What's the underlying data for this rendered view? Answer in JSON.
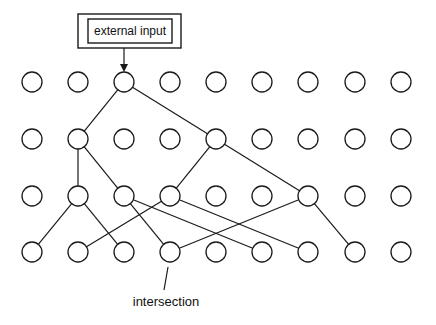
{
  "diagram": {
    "input_box": {
      "label": "external input"
    },
    "annotation": {
      "label": "intersection",
      "target": {
        "row": 3,
        "col": 3
      }
    },
    "grid": {
      "rows": 4,
      "cols": 9,
      "col_x": [
        32,
        78,
        124,
        170,
        216,
        262,
        308,
        355,
        401
      ],
      "row_y": [
        82,
        139,
        196,
        252
      ],
      "radius": 10
    },
    "input_target": {
      "row": 0,
      "col": 2
    },
    "edges": [
      {
        "from": [
          0,
          2
        ],
        "to": [
          1,
          1
        ]
      },
      {
        "from": [
          0,
          2
        ],
        "to": [
          1,
          4
        ]
      },
      {
        "from": [
          1,
          1
        ],
        "to": [
          2,
          1
        ]
      },
      {
        "from": [
          1,
          1
        ],
        "to": [
          2,
          2
        ]
      },
      {
        "from": [
          1,
          4
        ],
        "to": [
          2,
          3
        ]
      },
      {
        "from": [
          1,
          4
        ],
        "to": [
          2,
          6
        ]
      },
      {
        "from": [
          2,
          1
        ],
        "to": [
          3,
          0
        ]
      },
      {
        "from": [
          2,
          1
        ],
        "to": [
          3,
          2
        ]
      },
      {
        "from": [
          2,
          2
        ],
        "to": [
          3,
          3
        ]
      },
      {
        "from": [
          2,
          2
        ],
        "to": [
          3,
          5
        ]
      },
      {
        "from": [
          2,
          3
        ],
        "to": [
          3,
          1
        ]
      },
      {
        "from": [
          2,
          3
        ],
        "to": [
          3,
          6
        ]
      },
      {
        "from": [
          2,
          6
        ],
        "to": [
          3,
          3
        ]
      },
      {
        "from": [
          2,
          6
        ],
        "to": [
          3,
          7
        ]
      }
    ],
    "colors": {
      "stroke": "#1a1a1a",
      "background": "#ffffff"
    }
  }
}
